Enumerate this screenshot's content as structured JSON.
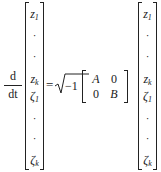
{
  "equation": {
    "derivative": {
      "numerator": "d",
      "denominator": "dt"
    },
    "left_vector": [
      {
        "base": "z",
        "sub": "1",
        "kind": "var"
      },
      {
        "base": "·",
        "sub": "",
        "kind": "dot"
      },
      {
        "base": "·",
        "sub": "",
        "kind": "dot"
      },
      {
        "base": "z",
        "sub": "k",
        "kind": "var"
      },
      {
        "base": "ζ",
        "sub": "1",
        "kind": "var"
      },
      {
        "base": "·",
        "sub": "",
        "kind": "dot"
      },
      {
        "base": "·",
        "sub": "",
        "kind": "dot"
      },
      {
        "base": "ζ",
        "sub": "k",
        "kind": "var"
      }
    ],
    "equals": "=",
    "scalar": {
      "radical": "√",
      "radicand": "−1"
    },
    "matrix": [
      [
        "A",
        "0"
      ],
      [
        "0",
        "B"
      ]
    ],
    "right_vector": [
      {
        "base": "z",
        "sub": "1",
        "kind": "var"
      },
      {
        "base": "·",
        "sub": "",
        "kind": "dot"
      },
      {
        "base": "·",
        "sub": "",
        "kind": "dot"
      },
      {
        "base": "z",
        "sub": "k",
        "kind": "var"
      },
      {
        "base": "ζ",
        "sub": "1",
        "kind": "var"
      },
      {
        "base": "·",
        "sub": "",
        "kind": "dot"
      },
      {
        "base": "·",
        "sub": "",
        "kind": "dot"
      },
      {
        "base": "ζ",
        "sub": "k",
        "kind": "var"
      }
    ]
  }
}
